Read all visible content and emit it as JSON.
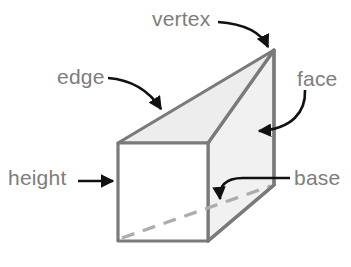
{
  "figure": {
    "shape_name": "triangular-prism",
    "colors": {
      "outline": "#7a7a7a",
      "face_fill": "#f1f1f1",
      "top_face_fill": "#ececec",
      "hidden_edge": "#a8a8a8",
      "label_text": "#7d7d7d",
      "arrow": "#111111",
      "background": "#ffffff"
    },
    "labels": {
      "vertex": "vertex",
      "edge": "edge",
      "face": "face",
      "height": "height",
      "base": "base"
    },
    "caption": ""
  },
  "geometry": {
    "front_face": {
      "top_left": [
        118,
        143
      ],
      "top_right": [
        208,
        143
      ],
      "bottom_right": [
        208,
        241
      ],
      "bottom_left": [
        118,
        241
      ]
    },
    "apex": [
      274,
      50
    ],
    "right_lower_vertex": [
      274,
      185
    ],
    "hidden_edge": {
      "from": [
        122,
        238
      ],
      "to": [
        271,
        185
      ]
    }
  },
  "annotations": [
    {
      "name": "vertex",
      "arrow": "curve-down-right",
      "points_to": [
        270,
        52
      ]
    },
    {
      "name": "edge",
      "arrow": "curve-down-right",
      "points_to": [
        165,
        113
      ]
    },
    {
      "name": "face",
      "arrow": "curve-down-left",
      "points_to": [
        253,
        133
      ]
    },
    {
      "name": "height",
      "arrow": "straight-right",
      "points_to": [
        116,
        182
      ]
    },
    {
      "name": "base",
      "arrow": "curve-left-down",
      "points_to": [
        222,
        203
      ]
    }
  ]
}
